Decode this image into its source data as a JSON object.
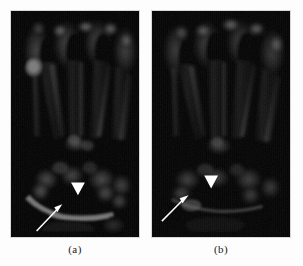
{
  "figure": {
    "background_color": "#ffffff",
    "panel_background": "#000000",
    "marker_color": "#ffffff",
    "panels": [
      {
        "id": "a",
        "caption": "(a)",
        "modality": "MRI",
        "view": "coronal",
        "body_part": "hand and wrist",
        "annotations": [
          {
            "type": "arrowhead",
            "label": "arrowhead-marker",
            "x": 68,
            "y": 180,
            "direction": "down"
          },
          {
            "type": "arrow",
            "label": "arrow-marker",
            "x": 40,
            "y": 212,
            "direction": "up-right"
          }
        ],
        "findings": [
          {
            "label": "hyperintense-lesion",
            "x": 24,
            "y": 58,
            "radius": 9,
            "intensity": "high"
          },
          {
            "label": "fluid-collection-band",
            "region": "carpal-row",
            "intensity": "high"
          }
        ]
      },
      {
        "id": "b",
        "caption": "(b)",
        "modality": "MRI",
        "view": "coronal",
        "body_part": "hand and wrist",
        "annotations": [
          {
            "type": "arrowhead",
            "label": "arrowhead-marker",
            "x": 211,
            "y": 173,
            "direction": "down"
          },
          {
            "type": "arrow",
            "label": "arrow-marker",
            "x": 178,
            "y": 203,
            "direction": "up-right"
          }
        ],
        "findings": [
          {
            "label": "carpal-signal-region",
            "region": "carpal-row",
            "intensity": "moderate"
          }
        ]
      }
    ]
  }
}
